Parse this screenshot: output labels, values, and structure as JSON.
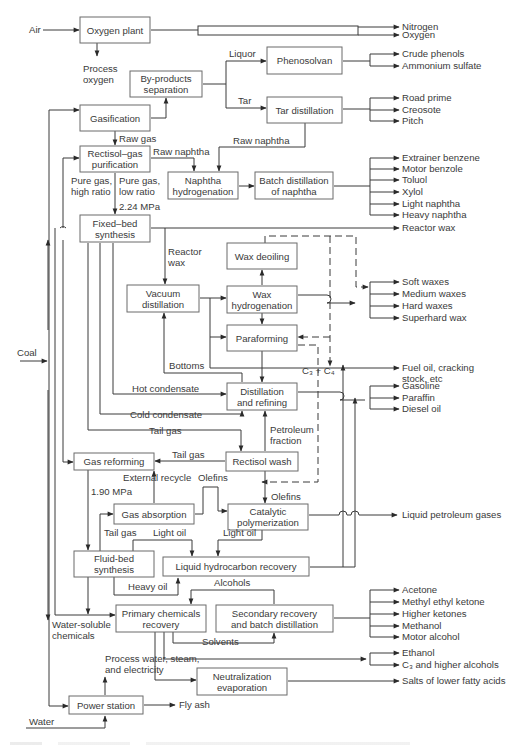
{
  "diagram": {
    "caption": "",
    "colors": {
      "line": "#3a3a3a",
      "box_border": "#6b6b6b",
      "text": "#3a3a3a",
      "background": "#ffffff"
    },
    "units": [
      {
        "id": "oxygen_plant",
        "lines": [
          "Oxygen plant"
        ],
        "x": 80,
        "y": 17,
        "w": 70,
        "h": 26
      },
      {
        "id": "byproducts_separation",
        "lines": [
          "By-products",
          "separation"
        ],
        "x": 130,
        "y": 71,
        "w": 72,
        "h": 26
      },
      {
        "id": "phenosolvan",
        "lines": [
          "Phenosolvan"
        ],
        "x": 267,
        "y": 47,
        "w": 75,
        "h": 27
      },
      {
        "id": "tar_distillation",
        "lines": [
          "Tar distillation"
        ],
        "x": 267,
        "y": 97,
        "w": 75,
        "h": 26
      },
      {
        "id": "gasification",
        "lines": [
          "Gasification"
        ],
        "x": 80,
        "y": 105,
        "w": 70,
        "h": 26
      },
      {
        "id": "rectisol_gas_purification",
        "lines": [
          "Rectisol–gas",
          "purification"
        ],
        "x": 80,
        "y": 146,
        "w": 70,
        "h": 26
      },
      {
        "id": "naphtha_hydrogenation",
        "lines": [
          "Naphtha",
          "hydrogenation"
        ],
        "x": 168,
        "y": 172,
        "w": 70,
        "h": 27
      },
      {
        "id": "batch_distillation_naphtha",
        "lines": [
          "Batch distillation",
          "of naphtha"
        ],
        "x": 255,
        "y": 172,
        "w": 78,
        "h": 27
      },
      {
        "id": "fixed_bed_synthesis",
        "lines": [
          "Fixed–bed",
          "synthesis"
        ],
        "x": 80,
        "y": 215,
        "w": 70,
        "h": 27
      },
      {
        "id": "wax_deoiling",
        "lines": [
          "Wax deoiling"
        ],
        "x": 227,
        "y": 243,
        "w": 70,
        "h": 26
      },
      {
        "id": "vacuum_distillation",
        "lines": [
          "Vacuum",
          "distillation"
        ],
        "x": 127,
        "y": 285,
        "w": 72,
        "h": 27
      },
      {
        "id": "wax_hydrogenation",
        "lines": [
          "Wax",
          "hydrogenation"
        ],
        "x": 227,
        "y": 286,
        "w": 70,
        "h": 27
      },
      {
        "id": "paraforming",
        "lines": [
          "Paraforming"
        ],
        "x": 227,
        "y": 325,
        "w": 70,
        "h": 26
      },
      {
        "id": "distillation_refining",
        "lines": [
          "Distillation",
          "and refining"
        ],
        "x": 227,
        "y": 383,
        "w": 70,
        "h": 27
      },
      {
        "id": "gas_reforming",
        "lines": [
          "Gas reforming"
        ],
        "x": 74,
        "y": 453,
        "w": 80,
        "h": 17
      },
      {
        "id": "rectisol_wash",
        "lines": [
          "Rectisol wash"
        ],
        "x": 226,
        "y": 452,
        "w": 72,
        "h": 19
      },
      {
        "id": "gas_absorption",
        "lines": [
          "Gas absorption"
        ],
        "x": 114,
        "y": 504,
        "w": 80,
        "h": 20
      },
      {
        "id": "catalytic_polymerization",
        "lines": [
          "Catalytic",
          "polymerization"
        ],
        "x": 228,
        "y": 504,
        "w": 80,
        "h": 26
      },
      {
        "id": "fluid_bed_synthesis",
        "lines": [
          "Fluid-bed",
          "synthesis"
        ],
        "x": 74,
        "y": 551,
        "w": 80,
        "h": 26
      },
      {
        "id": "liquid_hydrocarbon_recovery",
        "lines": [
          "Liquid hydrocarbon recovery"
        ],
        "x": 163,
        "y": 557,
        "w": 146,
        "h": 19
      },
      {
        "id": "primary_chemicals_recovery",
        "lines": [
          "Primary chemicals",
          "recovery"
        ],
        "x": 116,
        "y": 605,
        "w": 90,
        "h": 27
      },
      {
        "id": "secondary_recovery",
        "lines": [
          "Secondary recovery",
          "and batch distillation"
        ],
        "x": 216,
        "y": 605,
        "w": 117,
        "h": 27
      },
      {
        "id": "neutralization_evaporation",
        "lines": [
          "Neutralization",
          "evaporation"
        ],
        "x": 197,
        "y": 668,
        "w": 90,
        "h": 27
      },
      {
        "id": "power_station",
        "lines": [
          "Power station"
        ],
        "x": 69,
        "y": 696,
        "w": 74,
        "h": 18
      }
    ],
    "inputs": [
      {
        "id": "air",
        "label": "Air",
        "x": 29,
        "y": 33
      },
      {
        "id": "coal",
        "label": "Coal",
        "x": 17,
        "y": 356
      },
      {
        "id": "water",
        "label": "Water",
        "x": 29,
        "y": 725
      }
    ],
    "outputs": {
      "oxygen_plant": [
        "Nitrogen",
        "Oxygen"
      ],
      "phenosolvan": [
        "Crude phenols",
        "Ammonium sulfate"
      ],
      "tar_distillation": [
        "Road prime",
        "Creosote",
        "Pitch"
      ],
      "batch_distillation_naphtha": [
        "Extrainer benzene",
        "Motor benzole",
        "Toluol",
        "Xylol",
        "Light naphtha",
        "Heavy naphtha"
      ],
      "fixed_bed_synthesis": [
        "Reactor wax"
      ],
      "wax_products": [
        "Soft waxes",
        "Medium waxes",
        "Hard waxes",
        "Superhard wax"
      ],
      "fuel_oil": [
        "Fuel oil, cracking",
        "stock, etc"
      ],
      "distillation_refining": [
        "Gasoline",
        "Paraffin",
        "Diesel oil"
      ],
      "catalytic_polymerization": [
        "Liquid petroleum gases"
      ],
      "secondary_recovery": [
        "Acetone",
        "Methyl ethyl ketone",
        "Higher ketones",
        "Methanol",
        "Motor alcohol"
      ],
      "alcohols": [
        "Ethanol",
        "C₃ and higher alcohols"
      ],
      "neutralization_evaporation": [
        "Salts of lower fatty acids"
      ],
      "power_station": [
        "Fly ash"
      ]
    },
    "stream_labels": [
      {
        "id": "process_oxygen",
        "lines": [
          "Process",
          "oxygen"
        ],
        "x": 83,
        "y": 72
      },
      {
        "id": "liquor",
        "lines": [
          "Liquor"
        ],
        "x": 229,
        "y": 57
      },
      {
        "id": "tar",
        "lines": [
          "Tar"
        ],
        "x": 238,
        "y": 104
      },
      {
        "id": "raw_gas",
        "lines": [
          "Raw gas"
        ],
        "x": 119,
        "y": 142
      },
      {
        "id": "raw_naphtha_1",
        "lines": [
          "Raw naphtha"
        ],
        "x": 153,
        "y": 155
      },
      {
        "id": "raw_naphtha_2",
        "lines": [
          "Raw naphtha"
        ],
        "x": 233,
        "y": 144
      },
      {
        "id": "pure_gas_high",
        "lines": [
          "Pure gas,",
          "high ratio"
        ],
        "x": 71,
        "y": 184
      },
      {
        "id": "pure_gas_low",
        "lines": [
          "Pure gas,",
          "low ratio"
        ],
        "x": 119,
        "y": 184
      },
      {
        "id": "pressure_224",
        "lines": [
          "2.24 MPa"
        ],
        "x": 119,
        "y": 210
      },
      {
        "id": "reactor_wax",
        "lines": [
          "Reactor",
          "wax"
        ],
        "x": 168,
        "y": 255
      },
      {
        "id": "bottoms",
        "lines": [
          "Bottoms"
        ],
        "x": 169,
        "y": 369
      },
      {
        "id": "c3_c4",
        "lines": [
          "C₃ + C₄"
        ],
        "x": 302,
        "y": 374
      },
      {
        "id": "hot_condensate",
        "lines": [
          "Hot condensate"
        ],
        "x": 132,
        "y": 392
      },
      {
        "id": "cold_condensate",
        "lines": [
          "Cold condensate"
        ],
        "x": 130,
        "y": 418
      },
      {
        "id": "tail_gas_1",
        "lines": [
          "Tail gas"
        ],
        "x": 149,
        "y": 434
      },
      {
        "id": "petroleum_fraction",
        "lines": [
          "Petroleum",
          "fraction"
        ],
        "x": 270,
        "y": 433
      },
      {
        "id": "tail_gas_2",
        "lines": [
          "Tail gas"
        ],
        "x": 172,
        "y": 458
      },
      {
        "id": "external_recycle",
        "lines": [
          "External recycle"
        ],
        "x": 123,
        "y": 481
      },
      {
        "id": "olefins_1",
        "lines": [
          "Olefins"
        ],
        "x": 198,
        "y": 481
      },
      {
        "id": "pressure_190",
        "lines": [
          "1.90 MPa"
        ],
        "x": 91,
        "y": 495
      },
      {
        "id": "olefins_2",
        "lines": [
          "Olefins"
        ],
        "x": 271,
        "y": 500
      },
      {
        "id": "tail_gas_3",
        "lines": [
          "Tail gas"
        ],
        "x": 104,
        "y": 536
      },
      {
        "id": "light_oil_1",
        "lines": [
          "Light oil"
        ],
        "x": 153,
        "y": 536
      },
      {
        "id": "light_oil_2",
        "lines": [
          "Light oil"
        ],
        "x": 223,
        "y": 536
      },
      {
        "id": "heavy_oil",
        "lines": [
          "Heavy oil"
        ],
        "x": 128,
        "y": 590
      },
      {
        "id": "alcohols",
        "lines": [
          "Alcohols"
        ],
        "x": 214,
        "y": 586
      },
      {
        "id": "water_soluble",
        "lines": [
          "Water-soluble",
          "chemicals"
        ],
        "x": 52,
        "y": 628
      },
      {
        "id": "solvents",
        "lines": [
          "Solvents"
        ],
        "x": 202,
        "y": 645
      },
      {
        "id": "process_water",
        "lines": [
          "Process water, steam,",
          "and electricity"
        ],
        "x": 105,
        "y": 662
      }
    ]
  }
}
